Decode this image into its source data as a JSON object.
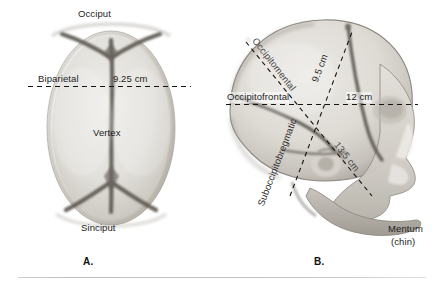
{
  "figure": {
    "panel_a": {
      "caption": "A.",
      "view": "superior-view-fetal-skull",
      "labels": {
        "occiput": "Occiput",
        "sinciput": "Sinciput",
        "vertex": "Vertex",
        "diameter_name": "Biparietal",
        "diameter_value": "9.25 cm"
      }
    },
    "panel_b": {
      "caption": "B.",
      "view": "lateral-view-fetal-skull",
      "labels": {
        "occipitofrontal_name": "Occipitofrontal",
        "occipitofrontal_value": "12 cm",
        "occipitomental_name": "Occipitomental",
        "occipitomental_value": "13.5 cm",
        "suboccipitobregmatic_name": "Suboccipitobregmatic",
        "suboccipitobregmatic_value": "9.5 cm",
        "mentum_line1": "Mentum",
        "mentum_line2": "(chin)"
      }
    }
  },
  "colors": {
    "background": "#ffffff",
    "text": "#1a1a1a",
    "measurement_line": "#141414",
    "bone_light": "#e8e6e2",
    "bone_mid": "#cfccc6",
    "suture_dark": "#57534d",
    "rule": "#c8c8c8"
  }
}
